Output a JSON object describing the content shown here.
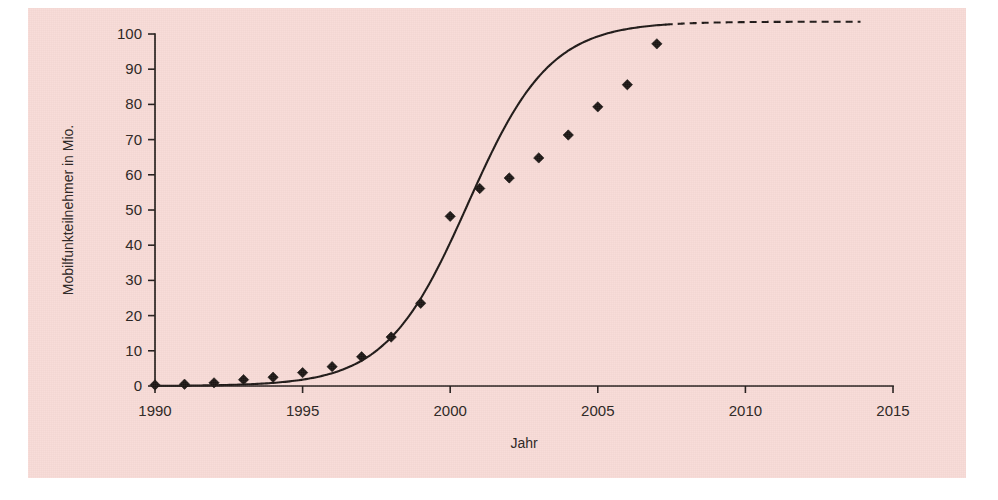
{
  "figure": {
    "background_color": "#ffffff",
    "panel_color": "#f8dbd7",
    "ink_color": "#1d1715"
  },
  "chart_data": {
    "type": "scatter",
    "title": "",
    "subtitle": "",
    "xlabel": "Jahr",
    "ylabel": "Mobilfunkteilnehmer in Mio.",
    "xlim": [
      1990,
      2015
    ],
    "ylim": [
      0,
      100
    ],
    "xticks": [
      1990,
      1995,
      2000,
      2005,
      2010,
      2015
    ],
    "xtick_labels": [
      "1990",
      "1995",
      "2000",
      "2005",
      "2010",
      "2015"
    ],
    "yticks": [
      0,
      10,
      20,
      30,
      40,
      50,
      60,
      70,
      80,
      90,
      100
    ],
    "ytick_labels": [
      "0",
      "10",
      "20",
      "30",
      "40",
      "50",
      "60",
      "70",
      "80",
      "90",
      "100"
    ],
    "grid": false,
    "legend": false,
    "legend_position": "none",
    "series": [
      {
        "name": "Mobilfunkteilnehmer",
        "type": "scatter",
        "marker": "diamond",
        "color": "#1b1513",
        "x": [
          1990,
          1991,
          1992,
          1993,
          1994,
          1995,
          1996,
          1997,
          1998,
          1999,
          2000,
          2001,
          2002,
          2003,
          2004,
          2005,
          2006,
          2007
        ],
        "values": [
          0.3,
          0.5,
          0.9,
          1.8,
          2.5,
          3.8,
          5.5,
          8.3,
          13.9,
          23.5,
          48.2,
          56.1,
          59.1,
          64.8,
          71.3,
          79.3,
          85.6,
          97.2
        ]
      },
      {
        "name": "Logistische Anpassung",
        "type": "line",
        "style": "solid",
        "color": "#1d1715",
        "model": "logistic",
        "L": 103.5,
        "k": 0.72,
        "x0": 2000.6,
        "x_range": [
          1990,
          2007.3
        ]
      },
      {
        "name": "Extrapolation",
        "type": "line",
        "style": "dashed",
        "color": "#1d1715",
        "model": "logistic",
        "L": 103.5,
        "k": 0.72,
        "x0": 2000.6,
        "x_range": [
          2007.3,
          2013.9
        ]
      }
    ],
    "annotations": []
  }
}
